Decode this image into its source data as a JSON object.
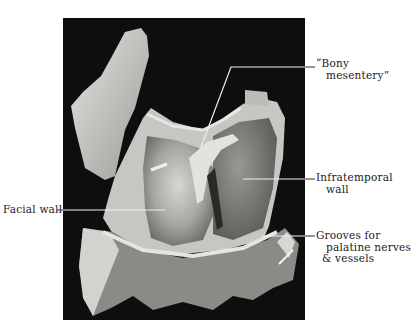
{
  "figure": {
    "background_color": "#0e0e0e",
    "labels": [
      {
        "id": "bony-mesentery",
        "line1": "“Bony",
        "line2": "mesentery”"
      },
      {
        "id": "infratemporal-wall",
        "line1": "Infratemporal",
        "line2": "wall"
      },
      {
        "id": "facial-wall",
        "line1": "Facial wall"
      },
      {
        "id": "grooves",
        "line1": "Grooves for",
        "line2": "palatine nerves",
        "line3": "& vessels"
      }
    ]
  }
}
